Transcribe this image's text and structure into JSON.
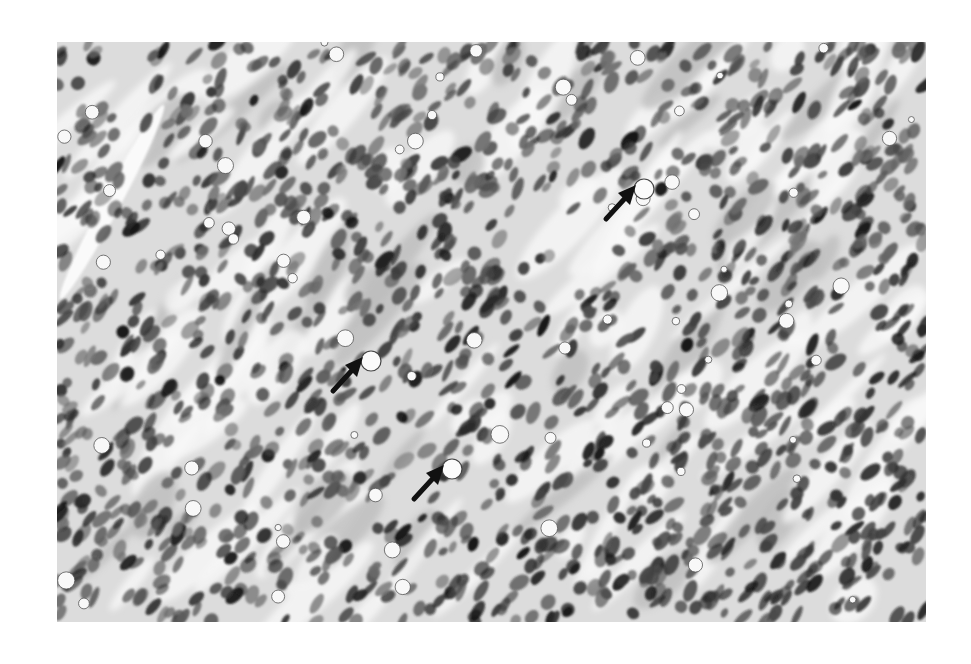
{
  "image": {
    "type": "histology-micrograph",
    "stain_appearance": "grayscale",
    "description": "Densely cellular tissue with spindle and ovoid dark nuclei arranged in diagonal fascicles; scattered clear vacuoles",
    "background_color": "#ffffff",
    "tissue_light_color": "#eeeeee",
    "nucleus_color": "#1e1e1e"
  },
  "annotations": {
    "arrows": [
      {
        "id": "arrow-1",
        "x": 620,
        "y": 203,
        "direction": "up-right",
        "target": "clear vacuole"
      },
      {
        "id": "arrow-2",
        "x": 347,
        "y": 375,
        "direction": "up-right",
        "target": "clear vacuole"
      },
      {
        "id": "arrow-3",
        "x": 428,
        "y": 483,
        "direction": "up-right",
        "target": "clear vacuole"
      }
    ],
    "arrow_color": "#111111"
  }
}
